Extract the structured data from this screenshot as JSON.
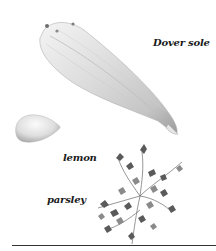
{
  "figure": {
    "items": [
      {
        "id": "dover-sole",
        "label": "Dover sole"
      },
      {
        "id": "lemon",
        "label": "lemon"
      },
      {
        "id": "parsley",
        "label": "parsley"
      }
    ]
  },
  "colors": {
    "background": "#ffffff",
    "label_text": "#1a1a1a",
    "rule": "#333333",
    "fish_light": "#ececec",
    "fish_shadow": "#9a9a9a",
    "lemon_light": "#f2f2f2",
    "lemon_shadow": "#a8a8a8",
    "parsley_dark": "#4a4a4a",
    "parsley_mid": "#7a7a7a"
  }
}
